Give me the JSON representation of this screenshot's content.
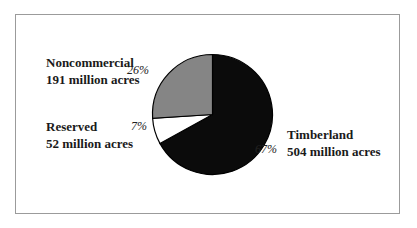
{
  "frame": {
    "border_color": "#9b9b9b",
    "background_color": "#ffffff"
  },
  "chart_data": {
    "type": "pie",
    "title": "",
    "start_angle_deg": 0,
    "direction": "clockwise",
    "stroke_color": "#000000",
    "legend_position": "none",
    "labels_position": "outside",
    "slices": [
      {
        "label": "Timberland",
        "sublabel": "504 million acres",
        "value": 504,
        "percent": 67,
        "percent_label": "67%",
        "color": "#0b0b0b"
      },
      {
        "label": "Reserved",
        "sublabel": "52 million acres",
        "value": 52,
        "percent": 7,
        "percent_label": "7%",
        "color": "#ffffff"
      },
      {
        "label": "Noncommercial",
        "sublabel": "191 million acres",
        "value": 191,
        "percent": 26,
        "percent_label": "26%",
        "color": "#858585"
      }
    ]
  }
}
